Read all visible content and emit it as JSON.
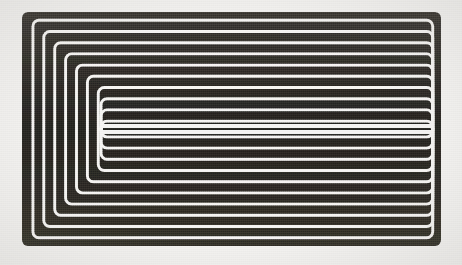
{
  "image": {
    "title": "Concentric Nested Rectangle Spiral",
    "description": "Abstract monochrome print of concentric rounded rectangles, offset so the innermost ring collapses into a narrow vertical hairpin left of centre; the right portion reads as horizontal bands and the left portion as nested U shapes.",
    "medium": "halftone scan",
    "width": 462,
    "height": 265
  },
  "canvas": {
    "background_color": "#f2f1ef",
    "ink_color": "#2b2926",
    "ink_color_light": "#3f3c37",
    "gap_color": "#f4f3f1",
    "width": 462,
    "height": 265
  },
  "figure": {
    "name": "concentric-rectangles",
    "left": 22,
    "top": 12,
    "right": 441,
    "bottom": 246,
    "ring_count": 21,
    "stroke_width": 8.3,
    "gap_width": 2.9,
    "step_x_left": 10.9,
    "step_x_right": 0.0,
    "step_y": 11.2,
    "corner_radius": 6,
    "center_x": 101,
    "center_y": 129,
    "inner_tip_top": 126,
    "inner_tip_bottom": 132
  },
  "chart_data": {
    "type": "line",
    "title": "Concentric Nested Rectangle Spiral",
    "xlabel": "",
    "ylabel": "",
    "xlim": [
      0,
      462
    ],
    "ylim": [
      0,
      265
    ],
    "grid": false,
    "legend": "none",
    "series": [
      {
        "name": "ring-0",
        "x": 22.0,
        "y": 12.0,
        "w": 419.0,
        "h": 234.0
      },
      {
        "name": "ring-1",
        "x": 32.9,
        "y": 23.2,
        "w": 408.1,
        "h": 211.6
      },
      {
        "name": "ring-2",
        "x": 43.8,
        "y": 34.4,
        "w": 397.2,
        "h": 189.2
      },
      {
        "name": "ring-3",
        "x": 54.7,
        "y": 45.6,
        "w": 386.3,
        "h": 166.8
      },
      {
        "name": "ring-4",
        "x": 65.6,
        "y": 56.8,
        "w": 375.4,
        "h": 144.4
      },
      {
        "name": "ring-5",
        "x": 76.5,
        "y": 68.0,
        "w": 364.5,
        "h": 122.0
      },
      {
        "name": "ring-6",
        "x": 87.4,
        "y": 79.2,
        "w": 353.6,
        "h": 99.6
      },
      {
        "name": "ring-7",
        "x": 98.3,
        "y": 90.4,
        "w": 342.7,
        "h": 77.2
      },
      {
        "name": "ring-8",
        "x": 101.0,
        "y": 101.6,
        "w": 340.0,
        "h": 54.8
      },
      {
        "name": "ring-9",
        "x": 101.0,
        "y": 112.8,
        "w": 340.0,
        "h": 32.4
      },
      {
        "name": "ring-10",
        "x": 101.0,
        "y": 124.0,
        "w": 340.0,
        "h": 10.0
      }
    ]
  }
}
